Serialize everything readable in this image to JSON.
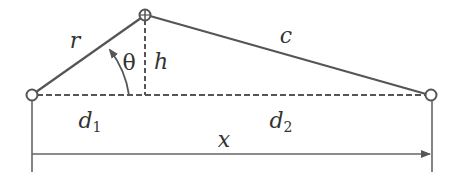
{
  "diagram": {
    "colors": {
      "line": "#555555",
      "text": "#333333",
      "background": "#ffffff"
    },
    "nodes": [
      {
        "id": "left",
        "x": 32,
        "y": 95
      },
      {
        "id": "top",
        "x": 145,
        "y": 15
      },
      {
        "id": "right",
        "x": 431,
        "y": 95
      }
    ],
    "labels": {
      "r": "r",
      "c": "c",
      "theta": "θ",
      "h": "h",
      "d1_base": "d",
      "d1_sub": "1",
      "d2_base": "d",
      "d2_sub": "2",
      "x": "x"
    },
    "segments": {
      "r": "left node to top node (solid)",
      "c": "top node to right node (solid)",
      "h": "vertical dashed height from top node to baseline",
      "baseline": "horizontal dashed line from left node to right node",
      "x": "dimension arrow from left to right"
    }
  }
}
